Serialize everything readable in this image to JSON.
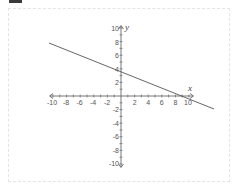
{
  "chart_data": {
    "type": "line",
    "title": "",
    "xlabel": "x",
    "ylabel": "y",
    "xlim": [
      -10,
      10
    ],
    "ylim": [
      -10,
      10
    ],
    "grid": false,
    "x_ticks": [
      -10,
      -8,
      -6,
      -4,
      -2,
      2,
      4,
      6,
      8,
      10
    ],
    "y_ticks": [
      10,
      8,
      6,
      4,
      2,
      -2,
      -4,
      -6,
      -8,
      -10
    ],
    "series": [
      {
        "name": "line",
        "equation": "y = -0.4x + 3.7",
        "points": [
          [
            -10.7,
            7.7
          ],
          [
            0,
            3.6
          ],
          [
            9.3,
            0
          ],
          [
            13.7,
            -1.7
          ]
        ],
        "color": "#555555"
      }
    ]
  },
  "labels": {
    "x_axis": "x",
    "y_axis": "y",
    "x_ticks": [
      "-10",
      "-8",
      "-6",
      "-4",
      "-2",
      "2",
      "4",
      "6",
      "8",
      "10"
    ],
    "y_ticks": [
      "10",
      "8",
      "6",
      "4",
      "2",
      "-2",
      "-4",
      "-6",
      "-8",
      "-10"
    ]
  }
}
